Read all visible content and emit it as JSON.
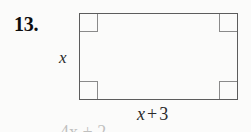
{
  "problem": {
    "number_label": "13.",
    "figure_type": "rectangle"
  },
  "figure": {
    "shape_name": "rectangle",
    "left_side_label": {
      "full_text": "x",
      "variable": "x"
    },
    "bottom_side_label": {
      "full_text": "x + 3",
      "variable": "x",
      "operator": "+",
      "constant": "3"
    },
    "right_angle_marker_count": 4,
    "corner_markers": [
      "top-left",
      "top-right",
      "bottom-left",
      "bottom-right"
    ]
  },
  "clipped_text": {
    "partial_line": "4x + 2"
  },
  "colors": {
    "page_background": "#fbfbfa",
    "shape_stroke": "#5c5c5c",
    "corner_marker_stroke": "#8a8a8a",
    "number_text": "#0d0d0d",
    "label_text": "#2a2a2a"
  }
}
